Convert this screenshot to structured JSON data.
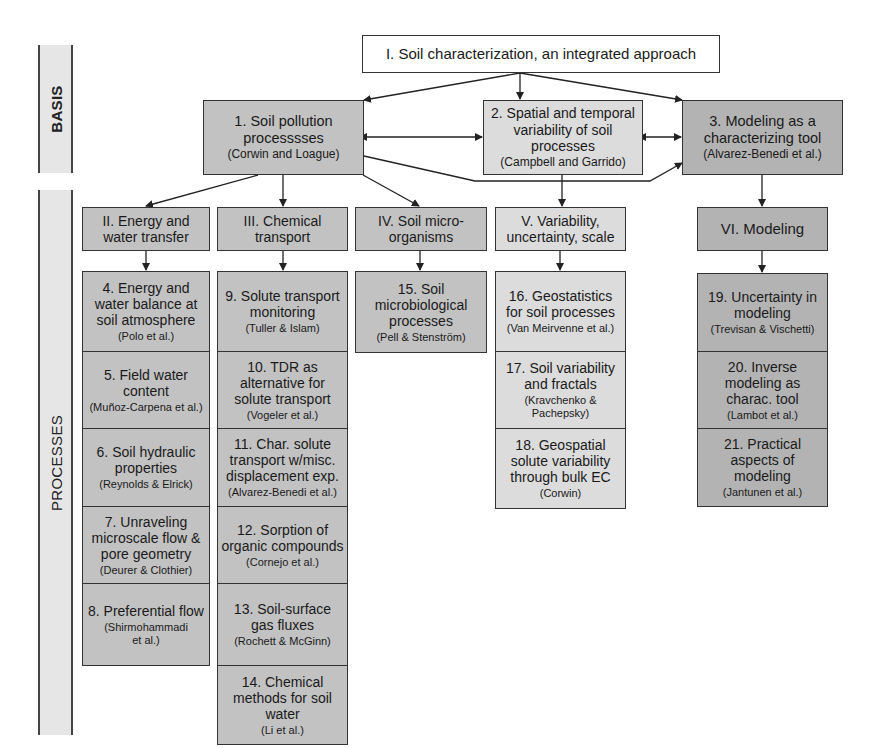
{
  "side_labels": {
    "basis": "BASIS",
    "processes": "PROCESSES"
  },
  "root": {
    "title": "I. Soil characterization, an integrated approach"
  },
  "basis": [
    {
      "title": "1. Soil pollution processsses",
      "author": "(Corwin and Loague)"
    },
    {
      "title": "2. Spatial and temporal variability of soil processes",
      "author": "(Campbell and Garrido)"
    },
    {
      "title": "3. Modeling as a characterizing tool",
      "author": "(Alvarez-Benedi et al.)"
    }
  ],
  "sections": [
    {
      "title": "II. Energy and water transfer",
      "chapters": [
        {
          "title": "4. Energy and water balance at soil atmosphere",
          "author": "(Polo et al.)"
        },
        {
          "title": "5. Field water content",
          "author": "(Muñoz-Carpena et al.)"
        },
        {
          "title": "6. Soil hydraulic properties",
          "author": "(Reynolds & Elrick)"
        },
        {
          "title": "7. Unraveling microscale flow & pore geometry",
          "author": "(Deurer & Clothier)"
        },
        {
          "title": "8. Preferential flow",
          "author": "(Shirmohammadi et al.)"
        }
      ]
    },
    {
      "title": "III. Chemical transport",
      "chapters": [
        {
          "title": "9. Solute transport monitoring",
          "author": "(Tuller & Islam)"
        },
        {
          "title": "10. TDR as alternative for solute transport",
          "author": "(Vogeler et al.)"
        },
        {
          "title": "11. Char. solute transport w/misc. displacement exp.",
          "author": "(Alvarez-Benedi et al.)"
        },
        {
          "title": "12. Sorption of organic compounds",
          "author": "(Cornejo et al.)"
        },
        {
          "title": "13. Soil-surface gas fluxes",
          "author": "(Rochett & McGinn)"
        },
        {
          "title": "14. Chemical methods for soil water",
          "author": "(Li et al.)"
        }
      ]
    },
    {
      "title": "IV. Soil micro-organisms",
      "chapters": [
        {
          "title": "15. Soil microbiological processes",
          "author": "(Pell & Stenström)"
        }
      ]
    },
    {
      "title": "V. Variability, uncertainty, scale",
      "chapters": [
        {
          "title": "16. Geostatistics for soil processes",
          "author": "(Van Meirvenne et al.)"
        },
        {
          "title": "17. Soil variability and fractals",
          "author": "(Kravchenko & Pachepsky)"
        },
        {
          "title": "18. Geospatial solute variability through bulk EC",
          "author": "(Corwin)"
        }
      ]
    },
    {
      "title": "VI. Modeling",
      "chapters": [
        {
          "title": "19. Uncertainty in modeling",
          "author": "(Trevisan & Vischetti)"
        },
        {
          "title": "20. Inverse modeling as charac. tool",
          "author": "(Lambot et al.)"
        },
        {
          "title": "21. Practical aspects of modeling",
          "author": "(Jantunen et al.)"
        }
      ]
    }
  ]
}
